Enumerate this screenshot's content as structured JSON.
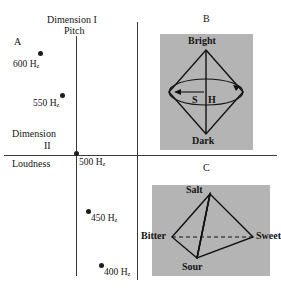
{
  "figure": {
    "background_color": "#ffffff",
    "plate_color": "#b4b4b4",
    "ink_color": "#141414"
  },
  "panel_a": {
    "letter": "A",
    "axis_x_title_line1": "Dimension I",
    "axis_x_title_line2": "Pitch",
    "axis_y_title_line1": "Dimension",
    "axis_y_title_line2": "II",
    "axis_y_title_line3": "Loudness",
    "origin_label": "500 H",
    "origin_sub": "z",
    "points": [
      {
        "label": "600 H",
        "sub": "z",
        "x": 41,
        "y": 54,
        "label_x": 13,
        "label_y": 60
      },
      {
        "label": "550 H",
        "sub": "z",
        "x": 63,
        "y": 96,
        "label_x": 33,
        "label_y": 99
      },
      {
        "label": "450 H",
        "sub": "z",
        "x": 88,
        "y": 212,
        "label_x": 93,
        "label_y": 214
      },
      {
        "label": "400 H",
        "sub": "z",
        "x": 101,
        "y": 266,
        "label_x": 106,
        "label_y": 268
      }
    ]
  },
  "panel_b": {
    "letter": "B",
    "top_label": "Bright",
    "bottom_label": "Dark",
    "axis_label_left": "S",
    "axis_label_right": "H"
  },
  "panel_c": {
    "letter": "C",
    "apex_label": "Salt",
    "left_label": "Bitter",
    "right_label": "Sweet",
    "front_label": "Sour"
  }
}
